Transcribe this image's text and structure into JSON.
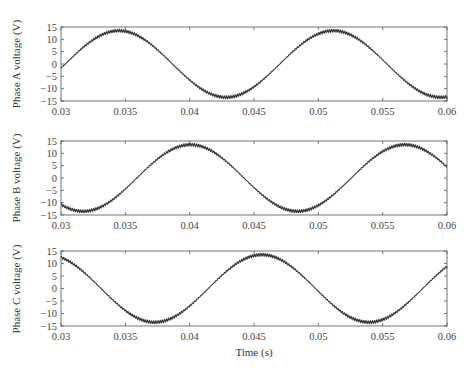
{
  "chart_data": [
    {
      "type": "line",
      "title": "",
      "xlabel": "",
      "ylabel": "Phase A voltage (V)",
      "xlim": [
        0.03,
        0.06
      ],
      "ylim": [
        -15,
        15
      ],
      "xticks": [
        0.03,
        0.035,
        0.04,
        0.045,
        0.05,
        0.055,
        0.06
      ],
      "xtick_labels": [
        "0.03",
        "0.035",
        "0.04",
        "0.045",
        "0.05",
        "0.055",
        "0.06"
      ],
      "yticks": [
        15,
        10,
        5,
        0,
        -5,
        -10,
        -15
      ],
      "ytick_labels": [
        "15",
        "10",
        "5",
        "0",
        "−5",
        "−10",
        "−15"
      ],
      "grid": false,
      "series": [
        {
          "name": "Phase A",
          "waveform": "sine",
          "frequency_hz": 60,
          "amplitude_v": 13.5,
          "peak_time_s": 0.0345,
          "x": [
            0.03,
            0.0345,
            0.0387,
            0.043,
            0.0472,
            0.0512,
            0.06
          ],
          "y": [
            -1.7,
            13.5,
            0,
            -13.5,
            0,
            13.5,
            -13.3
          ]
        }
      ]
    },
    {
      "type": "line",
      "title": "",
      "xlabel": "",
      "ylabel": "Phase B voltage (V)",
      "xlim": [
        0.03,
        0.06
      ],
      "ylim": [
        -15,
        15
      ],
      "xticks": [
        0.03,
        0.035,
        0.04,
        0.045,
        0.05,
        0.055,
        0.06
      ],
      "xtick_labels": [
        "0.03",
        "0.035",
        "0.04",
        "0.045",
        "0.05",
        "0.055",
        "0.06"
      ],
      "yticks": [
        15,
        10,
        5,
        0,
        -5,
        -10,
        -15
      ],
      "ytick_labels": [
        "15",
        "10",
        "5",
        "0",
        "−5",
        "−10",
        "−15"
      ],
      "grid": false,
      "series": [
        {
          "name": "Phase B",
          "waveform": "sine",
          "frequency_hz": 60,
          "amplitude_v": 13.5,
          "peak_time_s": 0.04006,
          "x": [
            0.03,
            0.0317,
            0.0359,
            0.0401,
            0.0443,
            0.0484,
            0.0526,
            0.0567,
            0.06
          ],
          "y": [
            -11.0,
            -13.5,
            0,
            13.5,
            0,
            -13.5,
            0,
            13.5,
            5.0
          ]
        }
      ]
    },
    {
      "type": "line",
      "title": "",
      "xlabel": "Time (s)",
      "ylabel": "Phase C voltage (V)",
      "xlim": [
        0.03,
        0.06
      ],
      "ylim": [
        -15,
        15
      ],
      "xticks": [
        0.03,
        0.035,
        0.04,
        0.045,
        0.05,
        0.055,
        0.06
      ],
      "xtick_labels": [
        "0.03",
        "0.035",
        "0.04",
        "0.045",
        "0.05",
        "0.055",
        "0.06"
      ],
      "yticks": [
        15,
        10,
        5,
        0,
        -5,
        -10,
        -15
      ],
      "ytick_labels": [
        "15",
        "10",
        "5",
        "0",
        "−5",
        "−10",
        "−15"
      ],
      "grid": false,
      "series": [
        {
          "name": "Phase C",
          "waveform": "sine",
          "frequency_hz": 60,
          "amplitude_v": 13.5,
          "peak_time_s": 0.04561,
          "x": [
            0.03,
            0.0331,
            0.0373,
            0.0415,
            0.0456,
            0.0498,
            0.054,
            0.06
          ],
          "y": [
            12.7,
            0,
            -13.5,
            0,
            13.5,
            0,
            -13.5,
            7.0
          ]
        }
      ]
    }
  ],
  "panels": [
    {
      "ylabel": "Phase A voltage (V)"
    },
    {
      "ylabel": "Phase B voltage (V)"
    },
    {
      "ylabel": "Phase C voltage (V)"
    }
  ],
  "xaxis": {
    "label": "Time (s)"
  }
}
